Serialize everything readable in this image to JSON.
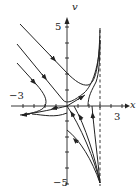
{
  "figure": {
    "type": "phase-portrait",
    "axes": {
      "x_label": "x",
      "y_label": "v",
      "x_tick_labels": {
        "left": "−3",
        "right": "3"
      },
      "y_tick_labels": {
        "top": "5",
        "bottom": "−5"
      },
      "x_range": [
        -5,
        5
      ],
      "y_range": [
        -5,
        5
      ],
      "asymptote": "x = 3 (dashed vertical line)"
    },
    "stroke_color": "#222222",
    "background": "#ffffff"
  }
}
